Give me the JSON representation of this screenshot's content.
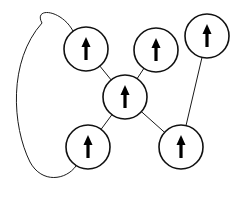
{
  "diagram": {
    "type": "graph",
    "colors": {
      "stroke": "#111111",
      "background": "#ffffff",
      "arrow": "#000000"
    },
    "nodes": [
      {
        "id": "A",
        "cx": 86,
        "cy": 49,
        "r": 22,
        "symbol": "up-arrow"
      },
      {
        "id": "B",
        "cx": 156,
        "cy": 50,
        "r": 22,
        "symbol": "up-arrow"
      },
      {
        "id": "C",
        "cx": 207,
        "cy": 36,
        "r": 22,
        "symbol": "up-arrow"
      },
      {
        "id": "D",
        "cx": 125,
        "cy": 97,
        "r": 22,
        "symbol": "up-arrow"
      },
      {
        "id": "E",
        "cx": 88,
        "cy": 147,
        "r": 22,
        "symbol": "up-arrow"
      },
      {
        "id": "F",
        "cx": 181,
        "cy": 147,
        "r": 22,
        "symbol": "up-arrow"
      }
    ],
    "edges": [
      {
        "from": "A",
        "to": "D",
        "shape": "straight"
      },
      {
        "from": "B",
        "to": "D",
        "shape": "straight"
      },
      {
        "from": "D",
        "to": "E",
        "shape": "straight"
      },
      {
        "from": "D",
        "to": "F",
        "shape": "straight"
      },
      {
        "from": "C",
        "to": "F",
        "shape": "straight"
      },
      {
        "from": "A",
        "to": "E",
        "shape": "curved-loop-left"
      }
    ]
  }
}
